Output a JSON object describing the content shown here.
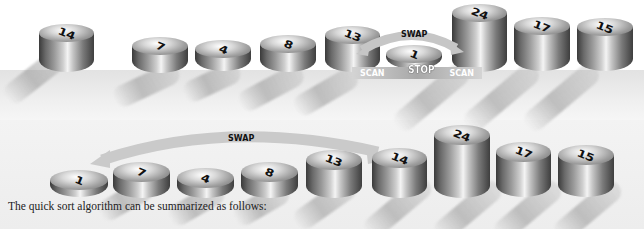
{
  "diagram": {
    "row1": {
      "values": [
        14,
        7,
        4,
        8,
        13,
        1,
        24,
        17,
        15
      ],
      "swap_label": "SWAP",
      "scan_left_label": "SCAN",
      "stop_label": "STOP",
      "scan_right_label": "SCAN"
    },
    "row2": {
      "values": [
        1,
        7,
        4,
        8,
        13,
        14,
        24,
        17,
        15
      ],
      "swap_label": "SWAP"
    },
    "caption": "The quick sort algorithm can be summarized as follows:"
  },
  "colors": {
    "cylinder_dark": "#3a3a3a",
    "cylinder_light": "#f4f4f4",
    "arrow": "#c9c9c9",
    "floor": "#e8e8e8"
  }
}
